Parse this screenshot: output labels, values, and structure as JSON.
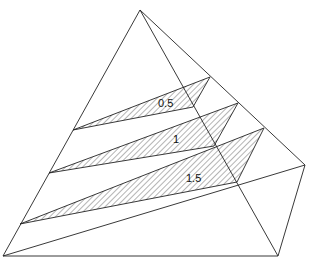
{
  "diagram": {
    "type": "pyramid with hatched cross-section slices",
    "labels": [
      {
        "text": "0.5",
        "x": 158,
        "y": 107
      },
      {
        "text": "1",
        "x": 173,
        "y": 143
      },
      {
        "text": "1.5",
        "x": 186,
        "y": 182
      }
    ],
    "colors": {
      "stroke": "#222222",
      "hatch": "#444444",
      "background": "#ffffff"
    }
  }
}
